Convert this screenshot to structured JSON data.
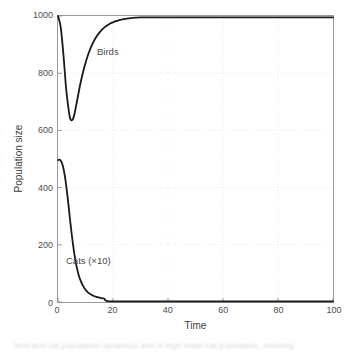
{
  "chart_data": {
    "type": "line",
    "title": "",
    "xlabel": "Time",
    "ylabel": "Population size",
    "xlim": [
      0,
      100
    ],
    "ylim": [
      0,
      1000
    ],
    "xticks": [
      0,
      20,
      40,
      60,
      80,
      100
    ],
    "yticks": [
      0,
      200,
      400,
      600,
      800,
      1000
    ],
    "grid": true,
    "grid_style": "dotted",
    "legend": "inline-annotations",
    "annotations": [
      {
        "text": "Birds",
        "x": 14,
        "y": 880
      },
      {
        "text": "Cats (×10)",
        "x": 4,
        "y": 165
      }
    ],
    "series": [
      {
        "name": "Birds",
        "color": "#1a1a1a",
        "x": [
          0,
          1,
          2,
          3,
          4,
          4.5,
          5,
          5.5,
          6,
          7,
          8,
          9,
          10,
          11,
          12,
          13,
          14,
          15,
          16,
          17,
          18,
          19,
          20,
          21,
          22,
          23,
          24,
          25,
          26,
          28,
          30,
          35,
          40,
          50,
          60,
          70,
          80,
          90,
          100
        ],
        "y": [
          1000,
          960,
          862,
          742,
          663,
          639,
          635,
          641,
          658,
          707,
          757,
          800,
          836,
          866,
          891,
          911,
          928,
          941,
          952,
          961,
          968,
          974,
          978,
          982,
          985,
          987,
          989,
          991,
          992,
          994,
          995,
          995,
          995,
          995,
          995,
          995,
          995,
          995,
          995
        ]
      },
      {
        "name": "Cats (×10)",
        "color": "#1a1a1a",
        "x": [
          0,
          0.6,
          1,
          1.5,
          2,
          2.5,
          3,
          3.5,
          4,
          4.5,
          5,
          5.5,
          6,
          6.5,
          7,
          7.5,
          8,
          9,
          10,
          11,
          12,
          13,
          14,
          15,
          16,
          16.8,
          17.2,
          18,
          20,
          25,
          30,
          40,
          50,
          60,
          70,
          80,
          90,
          100
        ],
        "y": [
          496,
          498,
          494,
          484,
          466,
          440,
          406,
          366,
          322,
          278,
          236,
          198,
          165,
          137,
          114,
          95,
          80,
          58,
          43,
          33,
          26,
          21,
          18,
          15,
          13,
          12,
          6,
          3,
          2,
          2,
          2,
          2,
          2,
          2,
          2,
          2,
          2,
          2
        ]
      }
    ]
  },
  "caption_fragment": "Bird and cat population dynamics with a high initial cat population, showing",
  "figure": {
    "background_color": "#ffffff",
    "axis_color": "#9a9a9a",
    "tick_label_color": "#4d4d4d",
    "line_color": "#1a1a1a"
  }
}
